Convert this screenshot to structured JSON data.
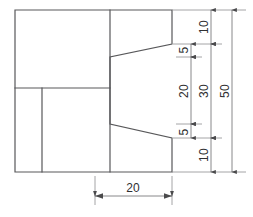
{
  "drawing": {
    "type": "engineering-orthographic-view",
    "background_color": "#ffffff",
    "line_color": "#58585a",
    "dimension_line_color": "#6a6a6c",
    "text_color": "#2f2f31",
    "part_outline_points": "15,10 172,10 172,44 110,57 110,124 172,138 172,172 15,172 15,10",
    "internal_edges": [
      {
        "name": "horizontal-divider",
        "x1": 15,
        "y1": 88,
        "x2": 110,
        "y2": 88
      },
      {
        "name": "vertical-divider-lower-left",
        "x1": 42,
        "y1": 88,
        "x2": 42,
        "y2": 172
      },
      {
        "name": "vertical-divider-mid",
        "x1": 110,
        "y1": 10,
        "x2": 110,
        "y2": 172
      }
    ]
  },
  "dimensions": {
    "vertical_column_left": {
      "axis_x": 191,
      "segments": [
        {
          "label": "5",
          "from_y": 44,
          "to_y": 57
        },
        {
          "label": "20",
          "from_y": 57,
          "to_y": 124
        },
        {
          "label": "5",
          "from_y": 124,
          "to_y": 138
        }
      ]
    },
    "vertical_column_middle": {
      "axis_x": 211,
      "segments": [
        {
          "label": "10",
          "from_y": 10,
          "to_y": 44
        },
        {
          "label": "30",
          "from_y": 44,
          "to_y": 138
        },
        {
          "label": "10",
          "from_y": 138,
          "to_y": 172
        }
      ]
    },
    "vertical_column_right": {
      "axis_x": 232,
      "segments": [
        {
          "label": "50",
          "from_y": 10,
          "to_y": 172
        }
      ]
    },
    "horizontal_bottom": {
      "axis_y": 196,
      "label": "20",
      "from_x": 95,
      "to_x": 172
    }
  },
  "labels": {
    "v_left_top": "5",
    "v_left_mid": "20",
    "v_left_bottom": "5",
    "v_mid_top": "10",
    "v_mid_mid": "30",
    "v_mid_bottom": "10",
    "v_right_total": "50",
    "h_bottom_width": "20"
  }
}
